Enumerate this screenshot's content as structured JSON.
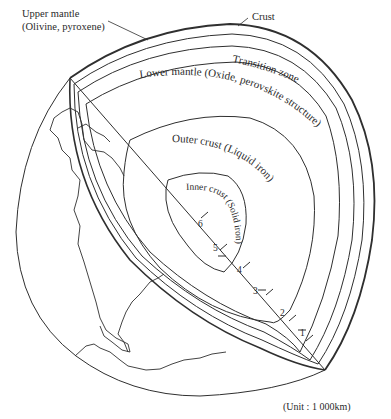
{
  "diagram": {
    "labels": {
      "upper_mantle_line1": "Upper mantle",
      "upper_mantle_line2": "(Olivine, pyroxene)",
      "crust": "Crust",
      "transition_zone": "Transition zone",
      "lower_mantle": "Lower mantle (Oxide, perovskite structure)",
      "outer_crust": "Outer crust (Liquid iron)",
      "inner_crust": "Inner crust (Solid iron)"
    },
    "depth_ticks": [
      "1",
      "2",
      "3",
      "4",
      "5",
      "6"
    ],
    "unit_note": "(Unit : 1 000km)",
    "colors": {
      "line": "#2f2f2f",
      "text": "#2a2a2a",
      "background": "#ffffff"
    }
  }
}
